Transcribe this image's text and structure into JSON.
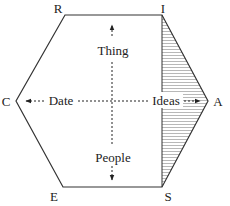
{
  "diagram": {
    "vertices": {
      "top_left": "R",
      "top_right": "I",
      "right": "A",
      "bottom_right": "S",
      "bottom_left": "E",
      "left": "C"
    },
    "axes": {
      "up": "Thing",
      "down": "People",
      "left": "Date",
      "right": "Ideas"
    },
    "shaded_region": "I-A-S triangle (hatched)",
    "colors": {
      "line": "#333333",
      "hatch": "#888888",
      "background": "#ffffff"
    }
  }
}
